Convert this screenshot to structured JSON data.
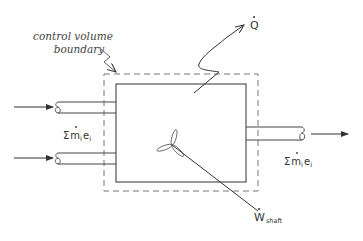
{
  "diagram": {
    "labels": {
      "boundary_line1": "control volume",
      "boundary_line2": "boundary",
      "heat": "Q",
      "heat_dot": "·",
      "inlet_sum_sigma": "Σ",
      "inlet_sum_m": "m",
      "inlet_sum_i": "i",
      "inlet_sum_e": "e",
      "inlet_sum_i2": "i",
      "outlet_sum_sigma": "Σ",
      "outlet_sum_m": "m",
      "outlet_sum_i": "i",
      "outlet_sum_e": "e",
      "outlet_sum_i2": "i",
      "work": "W",
      "work_sub": "shaft"
    },
    "elements": {
      "inlets": 2,
      "outlets": 1,
      "control_volume": "dashed rectangle",
      "device": "solid rectangle with shaft and fan"
    },
    "colors": {
      "line": "#444444",
      "dashed": "#777777",
      "background": "#ffffff"
    }
  }
}
